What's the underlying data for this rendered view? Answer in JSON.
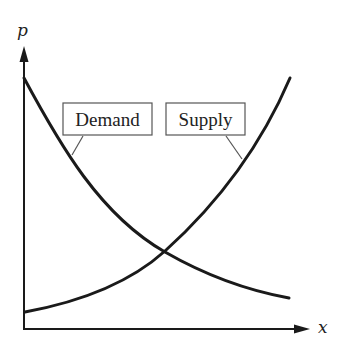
{
  "diagram": {
    "type": "supply-demand",
    "y_axis_label": "p",
    "x_axis_label": "x",
    "curves": [
      {
        "name": "Demand",
        "label": "Demand",
        "trend": "decreasing, convex"
      },
      {
        "name": "Supply",
        "label": "Supply",
        "trend": "increasing, convex"
      }
    ],
    "intersection": "equilibrium point where Demand and Supply cross"
  },
  "labels": {
    "demand": "Demand",
    "supply": "Supply",
    "p": "p",
    "x": "x"
  },
  "colors": {
    "line": "#1a1a1a",
    "box_border": "#555555",
    "background": "#ffffff"
  }
}
